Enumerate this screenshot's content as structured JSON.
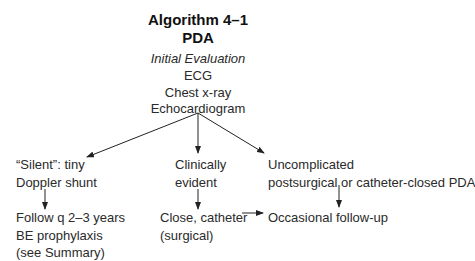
{
  "header": {
    "title": "Algorithm 4–1",
    "subtitle": "PDA",
    "evaluation_label": "Initial Evaluation",
    "evaluation_items": [
      "ECG",
      "Chest x-ray",
      "Echocardiogram"
    ]
  },
  "branches": [
    {
      "condition": [
        "“Silent”: tiny",
        "Doppler shunt"
      ],
      "action": [
        "Follow q 2–3 years",
        "BE prophylaxis",
        "(see Summary)"
      ]
    },
    {
      "condition": [
        "Clinically",
        "evident"
      ],
      "action": [
        "Close, catheter",
        "(surgical)"
      ]
    },
    {
      "condition": [
        "Uncomplicated",
        "postsurgical or catheter-closed PDA"
      ],
      "action": [
        "Occasional follow-up"
      ]
    }
  ]
}
